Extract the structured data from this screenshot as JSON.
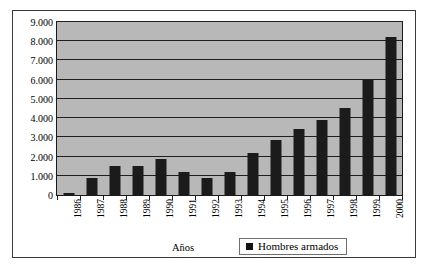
{
  "chart_data": {
    "type": "bar",
    "title": "",
    "subtitle": "",
    "xlabel": "Años",
    "ylabel": "",
    "categories": [
      "1986",
      "1987",
      "1988",
      "1989",
      "1990",
      "1991",
      "1992",
      "1993",
      "1994",
      "1995",
      "1996",
      "1997",
      "1998",
      "1999",
      "2000"
    ],
    "values": [
      120,
      900,
      1520,
      1520,
      1850,
      1180,
      900,
      1220,
      2200,
      2850,
      3450,
      3880,
      4550,
      6000,
      8200
    ],
    "series": [
      {
        "name": "Hombres armados",
        "values": [
          120,
          900,
          1520,
          1520,
          1850,
          1180,
          900,
          1220,
          2200,
          2850,
          3450,
          3880,
          4550,
          6000,
          8200
        ]
      }
    ],
    "ylim": [
      0,
      9000
    ],
    "ytick_values": [
      0,
      1000,
      2000,
      3000,
      4000,
      5000,
      6000,
      7000,
      8000,
      9000
    ],
    "ytick_labels": [
      "0",
      "1.000",
      "2.000",
      "3.000",
      "4.000",
      "5.000",
      "6.000",
      "7.000",
      "8.000",
      "9.000"
    ],
    "grid": true,
    "legend_position": "bottom-right",
    "bar_color": "#1b1b1b",
    "plot_background": "#b8b8b8"
  },
  "legend": {
    "entries": [
      {
        "label": "Hombres armados",
        "marker": "legend-square-marker",
        "color": "#121212"
      }
    ]
  },
  "axes": {
    "x_title": "Años"
  }
}
